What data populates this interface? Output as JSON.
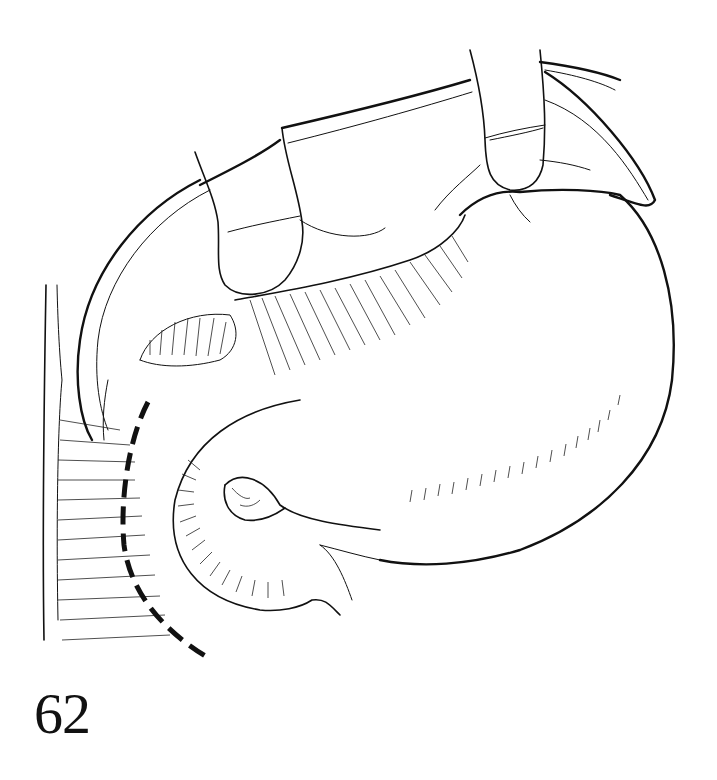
{
  "figure": {
    "number": "62",
    "type": "surgical-line-illustration",
    "colors": {
      "ink": "#111111",
      "background": "#ffffff"
    }
  },
  "elements": {
    "retractors": 2,
    "dashed_line": "incision-guide-line"
  }
}
